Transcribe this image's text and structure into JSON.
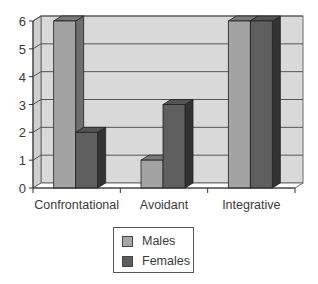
{
  "chart_data": {
    "type": "bar",
    "style": "3d-clustered-column",
    "title": "",
    "xlabel": "",
    "ylabel": "",
    "categories": [
      "Confrontational",
      "Avoidant",
      "Integrative"
    ],
    "series": [
      {
        "name": "Males",
        "values": [
          6,
          1,
          6
        ],
        "color": "#9a9a9a"
      },
      {
        "name": "Females",
        "values": [
          2,
          3,
          6
        ],
        "color": "#5e5e5e"
      }
    ],
    "ylim": [
      0,
      6
    ],
    "yticks": [
      "0",
      "1",
      "2",
      "3",
      "4",
      "5",
      "6"
    ],
    "grid": true,
    "legend_position": "bottom"
  },
  "legend": {
    "items": [
      {
        "label": "Males",
        "color": "#9a9a9a"
      },
      {
        "label": "Females",
        "color": "#5e5e5e"
      }
    ]
  }
}
